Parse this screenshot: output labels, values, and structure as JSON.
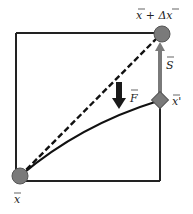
{
  "diagram": {
    "type": "vector-displacement",
    "labels": {
      "start": "x",
      "end": "x + Δx",
      "intermediate": "x'",
      "force": "F",
      "correction": "S"
    },
    "colors": {
      "frame": "#222222",
      "node_fill": "#7a7a7a",
      "node_stroke": "#555555",
      "correction_arrow": "#7a7a7a",
      "force_arrow": "#1a1a1a",
      "path": "#111111"
    },
    "elements": [
      {
        "id": "frame",
        "shape": "square",
        "description": "reference box"
      },
      {
        "id": "start-node",
        "shape": "circle",
        "label": "x"
      },
      {
        "id": "end-node",
        "shape": "circle",
        "label": "x + Δx"
      },
      {
        "id": "intermediate-node",
        "shape": "diamond",
        "label": "x'"
      },
      {
        "id": "direct-path",
        "style": "dashed",
        "from": "start-node",
        "to": "end-node"
      },
      {
        "id": "curved-path",
        "style": "solid-curve",
        "from": "start-node",
        "to": "intermediate-node"
      },
      {
        "id": "force-arrow",
        "direction": "down",
        "label": "F"
      },
      {
        "id": "correction-arrow",
        "direction": "up",
        "from": "intermediate-node",
        "to": "end-node",
        "label": "S"
      }
    ]
  }
}
